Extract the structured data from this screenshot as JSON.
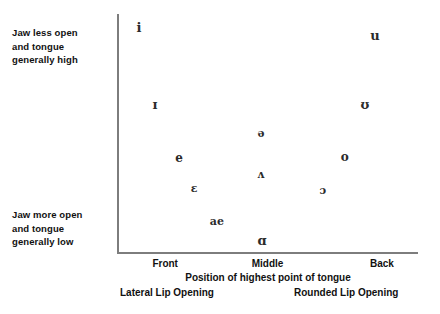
{
  "chart_data": {
    "type": "scatter",
    "title": "",
    "xlabel": "Position of highest point of tongue",
    "ylabel": "",
    "xlim": [
      0,
      100
    ],
    "ylim": [
      0,
      100
    ],
    "grid": false,
    "legend": "none",
    "x_tick_labels": [
      "Front",
      "Middle",
      "Back"
    ],
    "x_tick_positions": [
      16,
      50,
      88
    ],
    "axis_notes": {
      "y_top": "Jaw less open and tongue generally high",
      "y_bottom": "Jaw more open and tongue generally low",
      "x_left_extra": "Lateral Lip Opening",
      "x_right_extra": "Rounded Lip Opening"
    },
    "points": [
      {
        "label": "i",
        "x": 7.3,
        "y": 94.6,
        "size": 13
      },
      {
        "label": "u",
        "x": 85.7,
        "y": 91.2,
        "size": 13
      },
      {
        "label": "ɪ",
        "x": 12.6,
        "y": 62.3,
        "size": 13
      },
      {
        "label": "ʊ",
        "x": 82.4,
        "y": 62.3,
        "size": 13
      },
      {
        "label": "ə",
        "x": 47.8,
        "y": 50.0,
        "size": 11
      },
      {
        "label": "e",
        "x": 20.6,
        "y": 39.5,
        "size": 12
      },
      {
        "label": "o",
        "x": 75.7,
        "y": 39.9,
        "size": 12
      },
      {
        "label": "ʌ",
        "x": 47.8,
        "y": 32.8,
        "size": 11
      },
      {
        "label": "ɛ",
        "x": 25.6,
        "y": 26.8,
        "size": 11
      },
      {
        "label": "ɔ",
        "x": 68.4,
        "y": 26.0,
        "size": 11
      },
      {
        "label": "ae",
        "x": 33.2,
        "y": 13.0,
        "size": 11
      },
      {
        "label": "ɑ",
        "x": 48.2,
        "y": 5.0,
        "size": 13
      }
    ]
  },
  "notes": {
    "high_line_1": "Jaw less open",
    "high_line_2": "and tongue",
    "high_line_3": "generally high",
    "low_line_1": "Jaw more open",
    "low_line_2": "and tongue",
    "low_line_3": "generally low"
  },
  "axis": {
    "tick_front": "Front",
    "tick_middle": "Middle",
    "tick_back": "Back",
    "caption": "Position of highest point of tongue",
    "lip_lateral": "Lateral Lip Opening",
    "lip_rounded": "Rounded Lip Opening"
  },
  "colors": {
    "axis": "#7d7d7d",
    "text": "#111111",
    "symbol": "#2b2b2b",
    "background": "#ffffff"
  }
}
